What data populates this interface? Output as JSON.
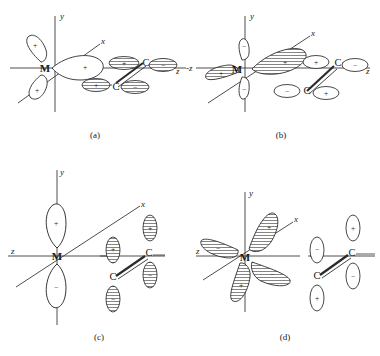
{
  "figure": {
    "width": 380,
    "height": 356,
    "background": "#ffffff",
    "stroke_color": "#2b2b2b",
    "hatch_color": "#555555"
  },
  "labels": {
    "metal": "M",
    "carbon": "C",
    "axis_x": "x",
    "axis_y": "y",
    "axis_z": "z",
    "axis_z_neg": "-z",
    "sign_plus": "+",
    "sign_minus": "−"
  },
  "panels": [
    {
      "id": "a",
      "caption": "(a)",
      "description": "Metal sigma-type orbital (all lobes positive) overlapping with alkene pi orbital; sigma donation",
      "axes": [
        {
          "name": "y",
          "label": "y",
          "orientation": "vertical"
        },
        {
          "name": "x",
          "label": "x",
          "orientation": "diagonal-up-right"
        },
        {
          "name": "z",
          "label": "z",
          "orientation": "horizontal-right"
        }
      ],
      "metal_lobes": [
        {
          "position": "upper-left",
          "sign": "+",
          "shaded": false
        },
        {
          "position": "lower-left",
          "sign": "+",
          "shaded": false
        },
        {
          "position": "right-toward-ligand",
          "sign": "+",
          "shaded": false
        }
      ],
      "carbon_lobes": [
        {
          "atom": "C-upper",
          "side": "inner",
          "sign": "+",
          "shaded": true
        },
        {
          "atom": "C-upper",
          "side": "outer",
          "sign": "−",
          "shaded": true
        },
        {
          "atom": "C-lower",
          "side": "inner",
          "sign": "+",
          "shaded": true
        },
        {
          "atom": "C-lower",
          "side": "outer",
          "sign": "−",
          "shaded": true
        }
      ]
    },
    {
      "id": "b",
      "caption": "(b)",
      "description": "Metal d-type orbital with hatched lobes overlapping alkene pi* orbital",
      "axes": [
        {
          "name": "y",
          "label": "y",
          "orientation": "vertical"
        },
        {
          "name": "x",
          "label": "x",
          "orientation": "diagonal-up-right"
        },
        {
          "name": "z",
          "label": "z",
          "orientation": "horizontal-right"
        },
        {
          "name": "-z",
          "label": "-z",
          "orientation": "horizontal-left"
        }
      ],
      "metal_lobes": [
        {
          "position": "upper-right-diagonal",
          "sign": "+",
          "shaded": true
        },
        {
          "position": "lower-left-diagonal",
          "sign": "+",
          "shaded": true
        },
        {
          "position": "up",
          "sign": "−",
          "shaded": false
        },
        {
          "position": "down",
          "sign": "−",
          "shaded": false
        }
      ],
      "carbon_lobes": [
        {
          "atom": "C-upper",
          "side": "inner",
          "sign": "+",
          "shaded": false
        },
        {
          "atom": "C-upper",
          "side": "outer",
          "sign": "−",
          "shaded": false
        },
        {
          "atom": "C-lower",
          "side": "inner",
          "sign": "−",
          "shaded": false
        },
        {
          "atom": "C-lower",
          "side": "outer",
          "sign": "+",
          "shaded": false
        }
      ]
    },
    {
      "id": "c",
      "caption": "(c)",
      "description": "Metal p-type orbital along y (plus up, minus down) with perpendicular alkene p orbitals",
      "axes": [
        {
          "name": "y",
          "label": "y",
          "orientation": "vertical"
        },
        {
          "name": "x",
          "label": "x",
          "orientation": "diagonal-up-right"
        },
        {
          "name": "z",
          "label": "z",
          "orientation": "horizontal-left"
        }
      ],
      "metal_lobes": [
        {
          "position": "up",
          "sign": "+",
          "shaded": false
        },
        {
          "position": "down",
          "sign": "−",
          "shaded": false
        }
      ],
      "carbon_lobes": [
        {
          "atom": "C-left",
          "side": "up",
          "sign": "+",
          "shaded": true
        },
        {
          "atom": "C-left",
          "side": "down",
          "sign": "−",
          "shaded": true
        },
        {
          "atom": "C-right",
          "side": "up",
          "sign": "+",
          "shaded": true
        },
        {
          "atom": "C-right",
          "side": "down",
          "sign": "−",
          "shaded": true
        }
      ]
    },
    {
      "id": "d",
      "caption": "(d)",
      "description": "Metal d-xy orbital with four hatched lobes and alkene p orbitals perpendicular to M-C axis",
      "axes": [
        {
          "name": "y",
          "label": "y",
          "orientation": "vertical"
        },
        {
          "name": "x",
          "label": "x",
          "orientation": "diagonal-up-right"
        },
        {
          "name": "z",
          "label": "z",
          "orientation": "horizontal-left"
        }
      ],
      "metal_lobes": [
        {
          "position": "upper-right",
          "sign": "+",
          "shaded": true
        },
        {
          "position": "upper-left",
          "sign": "−",
          "shaded": true
        },
        {
          "position": "lower-left",
          "sign": "+",
          "shaded": true
        },
        {
          "position": "lower-right",
          "sign": "−",
          "shaded": true
        }
      ],
      "carbon_lobes": [
        {
          "atom": "C-left",
          "side": "up",
          "sign": "−",
          "shaded": false
        },
        {
          "atom": "C-left",
          "side": "down",
          "sign": "+",
          "shaded": false
        },
        {
          "atom": "C-right",
          "side": "up",
          "sign": "+",
          "shaded": false
        },
        {
          "atom": "C-right",
          "side": "down",
          "sign": "−",
          "shaded": false
        }
      ]
    }
  ]
}
